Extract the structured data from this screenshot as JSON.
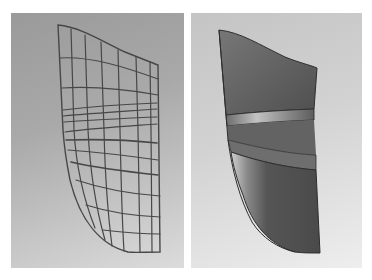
{
  "figure": {
    "panels": [
      {
        "name": "wireframe-mesh-view",
        "style": "wireframe",
        "background": "#a8a8a8",
        "line_color": "#4a4a4a"
      },
      {
        "name": "shaded-surface-view",
        "style": "shaded",
        "background": "#d8d8d8",
        "surface_color": "#5e5e5e"
      }
    ]
  },
  "colors": {
    "mesh_line": "#474747",
    "surface_dark": "#4f4f4f",
    "surface_mid": "#6a6a6a",
    "surface_highlight": "#bdbdbd",
    "edge": "#2e2e2e"
  }
}
